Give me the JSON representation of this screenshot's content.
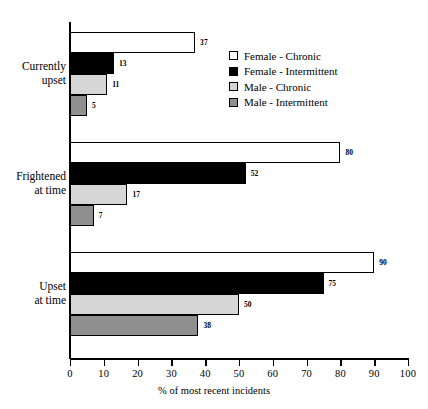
{
  "chart_data": {
    "type": "bar",
    "orientation": "horizontal",
    "title": "",
    "xlabel": "% of most recent incidents",
    "ylabel": "",
    "xlim": [
      0,
      100
    ],
    "xticks": [
      0,
      10,
      20,
      30,
      40,
      50,
      60,
      70,
      80,
      90,
      100
    ],
    "grid": false,
    "legend_position": "upper right",
    "categories": [
      "Currently\nupset",
      "Frightened\nat time",
      "Upset\nat time"
    ],
    "series": [
      {
        "name": "Female - Chronic",
        "swatch": "#ffffff",
        "values": [
          37,
          80,
          90
        ]
      },
      {
        "name": "Female - Intermittent",
        "swatch": "#000000",
        "values": [
          13,
          52,
          75
        ]
      },
      {
        "name": "Male - Chronic",
        "swatch": "#d6d6d6",
        "values": [
          11,
          17,
          50
        ]
      },
      {
        "name": "Male - Intermittent",
        "swatch": "#8f8f8f",
        "values": [
          5,
          7,
          38
        ]
      }
    ]
  }
}
